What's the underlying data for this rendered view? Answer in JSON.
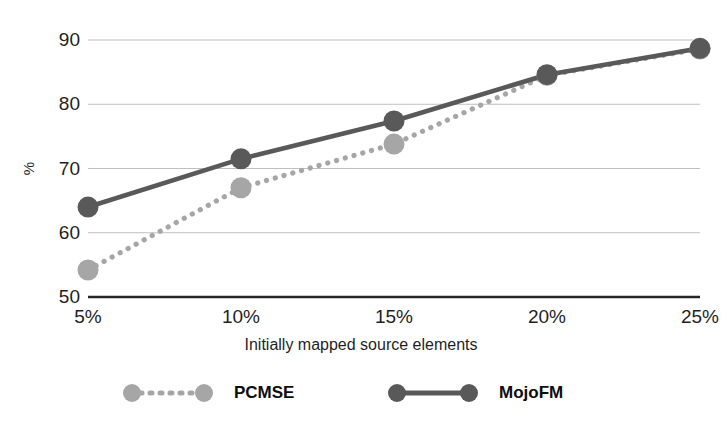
{
  "chart_data": {
    "type": "line",
    "title": "",
    "xlabel": "Initially mapped source elements",
    "ylabel": "%",
    "categories": [
      "5%",
      "10%",
      "15%",
      "20%",
      "25%"
    ],
    "x_tick_labels": [
      "5%",
      "10%",
      "15%",
      "20%",
      "25%"
    ],
    "y_tick_labels": [
      "50",
      "60",
      "70",
      "80",
      "90"
    ],
    "ylim": [
      50,
      90
    ],
    "y_ticks": [
      50,
      60,
      70,
      80,
      90
    ],
    "grid": "horizontal",
    "legend_position": "bottom",
    "series": [
      {
        "name": "PCMSE",
        "values": [
          54.2,
          67.0,
          73.8,
          84.5,
          88.6
        ],
        "color": "#a6a6a6",
        "line_style": "dotted",
        "marker": "circle"
      },
      {
        "name": "MojoFM",
        "values": [
          64.0,
          71.5,
          77.4,
          84.6,
          88.7
        ],
        "color": "#595959",
        "line_style": "solid",
        "marker": "circle"
      }
    ]
  },
  "axis": {
    "y_title": "%",
    "x_title": "Initially mapped source elements"
  },
  "legend": {
    "entries": [
      {
        "label": "PCMSE"
      },
      {
        "label": "MojoFM"
      }
    ]
  },
  "colors": {
    "series_light": "#a6a6a6",
    "series_dark": "#595959",
    "gridline": "#bfbfbf",
    "axis_line": "#262626",
    "background": "#ffffff",
    "text": "#1f1f1f"
  }
}
